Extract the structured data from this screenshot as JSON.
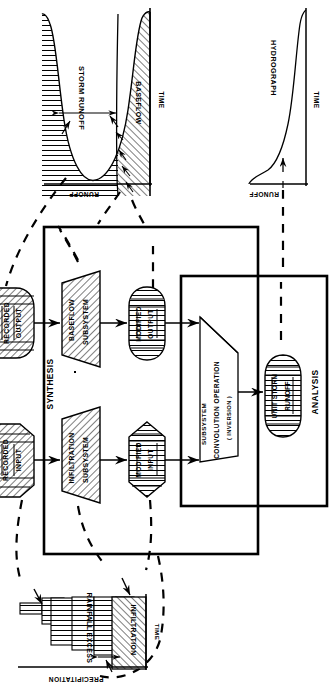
{
  "figure": {
    "type": "flow-diagram",
    "orientation": "rotated-90-ccw"
  },
  "top_left_chart": {
    "name": "storm-runoff-baseflow-hydrograph",
    "y_axis_label": "RUNOFF",
    "x_axis_label": "TIME",
    "regions": [
      {
        "label": "STORM RUNOFF",
        "hatch": "horizontal"
      },
      {
        "label": "BASEFLOW",
        "hatch": "diagonal"
      }
    ]
  },
  "top_right_chart": {
    "name": "unit-hydrograph",
    "title": "HYDROGRAPH",
    "y_axis_label": "RUNOFF",
    "x_axis_label": "TIME"
  },
  "bottom_chart": {
    "name": "precipitation-hyetograph",
    "y_axis_label": "PRECIPITATION",
    "x_axis_label": "TIME",
    "regions": [
      {
        "label": "RAINFALL EXCESS",
        "hatch": "horizontal"
      },
      {
        "label": "INFILTRATION",
        "hatch": "diagonal"
      }
    ]
  },
  "synthesis_box": {
    "label": "SYNTHESIS"
  },
  "analysis_box": {
    "label": "ANALYSIS"
  },
  "nodes": {
    "recorded_output": {
      "label_1": "RECORDED",
      "label_2": "OUTPUT"
    },
    "recorded_input": {
      "label_1": "RECORDED",
      "label_2": "INPUT"
    },
    "baseflow_subsystem": {
      "label_1": "BASEFLOW",
      "label_2": "SUBSYSTEM"
    },
    "infiltration_subsystem": {
      "label_1": "INFILTRATION",
      "label_2": "SUBSYSTEM"
    },
    "modified_output": {
      "label_1": "MODIFIED",
      "label_2": "OUTPUT"
    },
    "modified_input": {
      "label_1": "MODIFIED",
      "label_2": "INPUT"
    },
    "convolution": {
      "label_1": "SUBSYSTEM",
      "label_2": "CONVOLUTION OPERATION",
      "label_3": "( INVERSION )"
    },
    "unit_storm_runoff": {
      "label_1": "UNIT STORM",
      "label_2": "RUNOFF"
    }
  },
  "colors": {
    "ink": "#000000",
    "paper": "#ffffff",
    "hatch": "#1a1a1a"
  }
}
